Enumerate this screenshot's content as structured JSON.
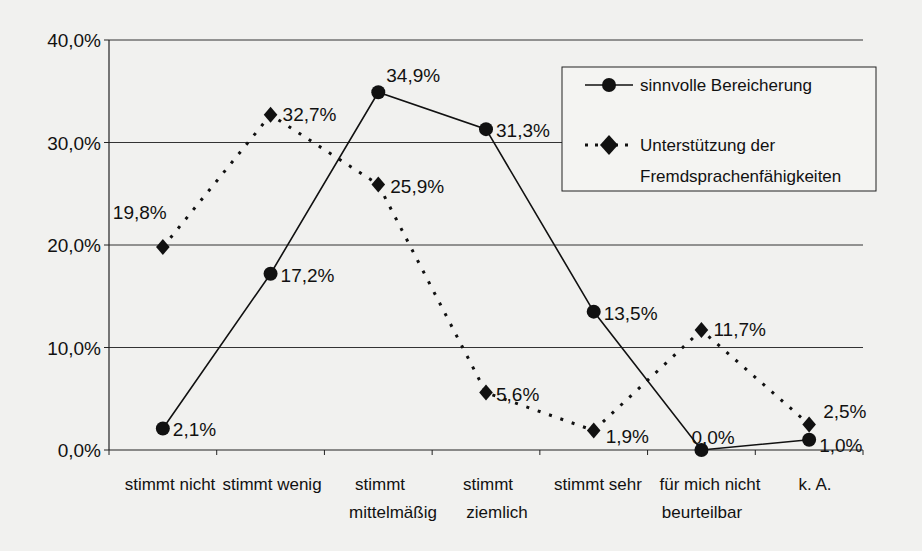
{
  "chart_data": {
    "type": "line",
    "title": "",
    "xlabel": "",
    "ylabel": "",
    "ylim": [
      0,
      40
    ],
    "yticks": [
      "0,0%",
      "10,0%",
      "20,0%",
      "30,0%",
      "40,0%"
    ],
    "grid": true,
    "legend_position": "upper right (inside plot)",
    "categories": [
      [
        "stimmt nicht"
      ],
      [
        "stimmt wenig"
      ],
      [
        "stimmt",
        "mittelmäßig"
      ],
      [
        "stimmt",
        "ziemlich"
      ],
      [
        "stimmt sehr"
      ],
      [
        "für mich nicht",
        "beurteilbar"
      ],
      [
        "k. A."
      ]
    ],
    "series": [
      {
        "name": "sinnvolle Bereicherung",
        "style": "solid",
        "marker": "circle",
        "values": [
          2.1,
          17.2,
          34.9,
          31.3,
          13.5,
          0.0,
          1.0
        ],
        "labels": [
          "2,1%",
          "17,2%",
          "34,9%",
          "31,3%",
          "13,5%",
          "0,0%",
          "1,0%"
        ]
      },
      {
        "name": "Unterstützung der Fremdsprachenfähigkeiten",
        "legend_lines": [
          "Unterstützung der",
          "Fremdsprachenfähigkeiten"
        ],
        "style": "dotted",
        "marker": "diamond",
        "values": [
          19.8,
          32.7,
          25.9,
          5.6,
          1.9,
          11.7,
          2.5
        ],
        "labels": [
          "19,8%",
          "32,7%",
          "25,9%",
          "5,6%",
          "1,9%",
          "11,7%",
          "2,5%"
        ]
      }
    ]
  },
  "legend": {
    "item1": "sinnvolle Bereicherung",
    "item2_line1": "Unterstützung der",
    "item2_line2": "Fremdsprachenfähigkeiten"
  }
}
